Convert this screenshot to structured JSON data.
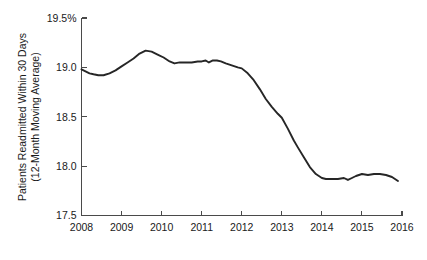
{
  "chart_data": {
    "type": "line",
    "title": "",
    "subtitle": "",
    "xlabel": "",
    "ylabel": "Patients Readmitted Within 30 Days (12-Month Moving Average)",
    "ylabel_lines": [
      "Patients Readmitted Within 30 Days",
      "(12-Month Moving Average)"
    ],
    "xlim": [
      2008,
      2016
    ],
    "ylim": [
      17.5,
      19.5
    ],
    "grid": false,
    "legend": false,
    "legend_position": "none",
    "line_color": "#262626",
    "axis_color": "#4a4a4a",
    "background_color": "#ffffff",
    "y_tick_labels": [
      "19.5%",
      "19.0",
      "18.5",
      "18.0",
      "17.5"
    ],
    "y_tick_values": [
      19.5,
      19.0,
      18.5,
      18.0,
      17.5
    ],
    "x_tick_labels": [
      "2008",
      "2009",
      "2010",
      "2011",
      "2012",
      "2013",
      "2014",
      "2015",
      "2016"
    ],
    "x_tick_values": [
      2008,
      2009,
      2010,
      2011,
      2012,
      2013,
      2014,
      2015,
      2016
    ],
    "series": [
      {
        "name": "Patients Readmitted Within 30 Days (12-Month Moving Average)",
        "x": [
          2008.0,
          2008.1,
          2008.2,
          2008.3,
          2008.42,
          2008.55,
          2008.7,
          2008.85,
          2009.0,
          2009.15,
          2009.3,
          2009.45,
          2009.6,
          2009.75,
          2009.9,
          2010.05,
          2010.2,
          2010.32,
          2010.45,
          2010.6,
          2010.75,
          2010.9,
          2011.0,
          2011.1,
          2011.18,
          2011.28,
          2011.38,
          2011.48,
          2011.6,
          2011.75,
          2011.9,
          2012.0,
          2012.15,
          2012.3,
          2012.45,
          2012.6,
          2012.75,
          2012.9,
          2013.0,
          2013.15,
          2013.3,
          2013.4,
          2013.55,
          2013.7,
          2013.85,
          2014.0,
          2014.1,
          2014.25,
          2014.4,
          2014.55,
          2014.65,
          2014.75,
          2014.85,
          2015.0,
          2015.15,
          2015.3,
          2015.45,
          2015.6,
          2015.75,
          2015.9
        ],
        "y": [
          18.98,
          18.96,
          18.94,
          18.93,
          18.92,
          18.92,
          18.94,
          18.97,
          19.01,
          19.05,
          19.09,
          19.14,
          19.17,
          19.16,
          19.13,
          19.1,
          19.06,
          19.04,
          19.05,
          19.05,
          19.05,
          19.06,
          19.06,
          19.07,
          19.05,
          19.07,
          19.07,
          19.06,
          19.04,
          19.02,
          19.0,
          18.99,
          18.94,
          18.87,
          18.78,
          18.68,
          18.6,
          18.53,
          18.49,
          18.38,
          18.26,
          18.19,
          18.09,
          17.99,
          17.92,
          17.88,
          17.87,
          17.87,
          17.87,
          17.88,
          17.86,
          17.88,
          17.9,
          17.92,
          17.91,
          17.92,
          17.92,
          17.91,
          17.89,
          17.85
        ]
      }
    ],
    "annotations": []
  }
}
